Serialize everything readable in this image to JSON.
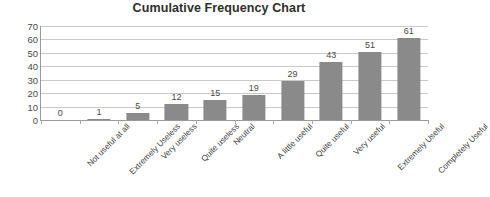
{
  "chart_data": {
    "type": "bar",
    "title": "Cumulative Frequency Chart",
    "xlabel": "",
    "ylabel": "",
    "ylim": [
      0,
      70
    ],
    "yticks": [
      0,
      10,
      20,
      30,
      40,
      50,
      60,
      70
    ],
    "grid": true,
    "legend": false,
    "bar_color": "#8a8a8a",
    "data_labels": true,
    "categories": [
      "Not useful at all",
      "Extremely Useless",
      "Very useless",
      "Quite useless",
      "Neutral",
      "A little useful",
      "Quite useful",
      "Very useful",
      "Extremely Useful",
      "Completely Useful"
    ],
    "values": [
      0,
      1,
      5,
      12,
      15,
      19,
      29,
      43,
      51,
      61
    ]
  }
}
